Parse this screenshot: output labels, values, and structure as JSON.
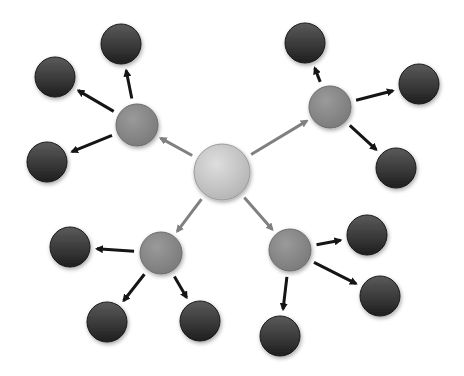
{
  "diagram": {
    "type": "hierarchical-radial-network",
    "background": "#ffffff",
    "colors": {
      "hub_fill": "#c9c9c9",
      "hub_edge": "#9a9a9a",
      "mid_fill": "#8a8a8a",
      "mid_edge": "#6d6d6d",
      "leaf_fill": "#3a3a3a",
      "leaf_edge": "#1a1a1a",
      "hub_arrow": "#808080",
      "leaf_arrow": "#151515"
    },
    "nodes": [
      {
        "id": "hub",
        "level": 0,
        "x": 222,
        "y": 172,
        "r": 28
      },
      {
        "id": "mid-tl",
        "level": 1,
        "x": 137,
        "y": 125,
        "r": 21
      },
      {
        "id": "mid-tr",
        "level": 1,
        "x": 330,
        "y": 107,
        "r": 21
      },
      {
        "id": "mid-bl",
        "level": 1,
        "x": 161,
        "y": 253,
        "r": 21
      },
      {
        "id": "mid-br",
        "level": 1,
        "x": 290,
        "y": 250,
        "r": 21
      },
      {
        "id": "leaf-tl-1",
        "level": 2,
        "x": 121,
        "y": 44,
        "r": 20
      },
      {
        "id": "leaf-tl-2",
        "level": 2,
        "x": 55,
        "y": 77,
        "r": 20
      },
      {
        "id": "leaf-tl-3",
        "level": 2,
        "x": 47,
        "y": 162,
        "r": 20
      },
      {
        "id": "leaf-tr-1",
        "level": 2,
        "x": 305,
        "y": 43,
        "r": 20
      },
      {
        "id": "leaf-tr-2",
        "level": 2,
        "x": 419,
        "y": 84,
        "r": 20
      },
      {
        "id": "leaf-tr-3",
        "level": 2,
        "x": 396,
        "y": 168,
        "r": 20
      },
      {
        "id": "leaf-bl-1",
        "level": 2,
        "x": 70,
        "y": 247,
        "r": 20
      },
      {
        "id": "leaf-bl-2",
        "level": 2,
        "x": 107,
        "y": 322,
        "r": 20
      },
      {
        "id": "leaf-bl-3",
        "level": 2,
        "x": 200,
        "y": 321,
        "r": 20
      },
      {
        "id": "leaf-br-1",
        "level": 2,
        "x": 367,
        "y": 235,
        "r": 20
      },
      {
        "id": "leaf-br-2",
        "level": 2,
        "x": 380,
        "y": 296,
        "r": 20
      },
      {
        "id": "leaf-br-3",
        "level": 2,
        "x": 280,
        "y": 336,
        "r": 20
      }
    ],
    "edges": [
      {
        "from": "hub",
        "to": "mid-tl"
      },
      {
        "from": "hub",
        "to": "mid-tr"
      },
      {
        "from": "hub",
        "to": "mid-bl"
      },
      {
        "from": "hub",
        "to": "mid-br"
      },
      {
        "from": "mid-tl",
        "to": "leaf-tl-1"
      },
      {
        "from": "mid-tl",
        "to": "leaf-tl-2"
      },
      {
        "from": "mid-tl",
        "to": "leaf-tl-3"
      },
      {
        "from": "mid-tr",
        "to": "leaf-tr-1"
      },
      {
        "from": "mid-tr",
        "to": "leaf-tr-2"
      },
      {
        "from": "mid-tr",
        "to": "leaf-tr-3"
      },
      {
        "from": "mid-bl",
        "to": "leaf-bl-1"
      },
      {
        "from": "mid-bl",
        "to": "leaf-bl-2"
      },
      {
        "from": "mid-bl",
        "to": "leaf-bl-3"
      },
      {
        "from": "mid-br",
        "to": "leaf-br-1"
      },
      {
        "from": "mid-br",
        "to": "leaf-br-2"
      },
      {
        "from": "mid-br",
        "to": "leaf-br-3"
      }
    ]
  }
}
